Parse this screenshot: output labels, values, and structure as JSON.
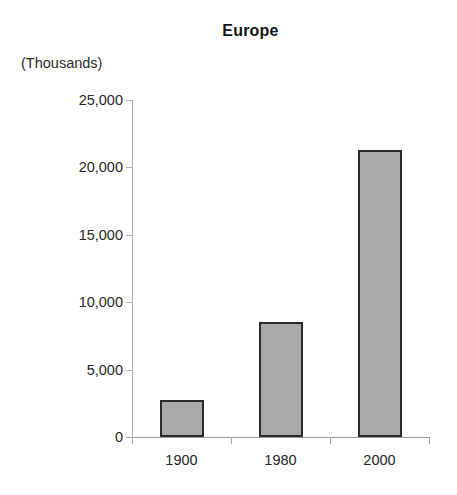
{
  "chart_data": {
    "type": "bar",
    "title": "Europe",
    "subtitle": "",
    "units_label": "(Thousands)",
    "xlabel": "",
    "ylabel": "",
    "categories": [
      "1900",
      "1980",
      "2000"
    ],
    "values": [
      2750,
      8550,
      21300
    ],
    "series": [
      {
        "name": "Europe",
        "values": [
          2750,
          8550,
          21300
        ]
      }
    ],
    "ylim": [
      0,
      25000
    ],
    "ytick_values": [
      0,
      5000,
      10000,
      15000,
      20000,
      25000
    ],
    "ytick_labels": [
      "0",
      "5,000",
      "10,000",
      "15,000",
      "20,000",
      "25,000"
    ],
    "grid": false,
    "legend": false,
    "legend_position": "none",
    "bar_fill_color": "#a9a9a9",
    "bar_border_color": "#2a2a2a",
    "axis_color": "#a8a8a8",
    "text_color": "#262626",
    "background_color": "#ffffff"
  }
}
